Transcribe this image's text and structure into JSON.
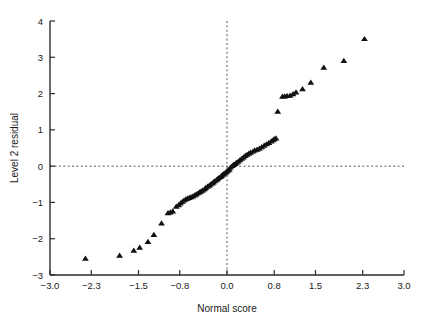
{
  "chart_data": {
    "type": "scatter",
    "title": "",
    "xlabel": "Normal score",
    "ylabel": "Level 2 residual",
    "xlim": [
      -3.0,
      3.0
    ],
    "ylim": [
      -3,
      4
    ],
    "xticks": [
      -3.0,
      -2.3,
      -1.5,
      -0.8,
      0.0,
      0.8,
      1.5,
      2.3,
      3.0
    ],
    "xtick_labels": [
      "-3.0",
      "-2.3",
      "-1.5",
      "-0.8",
      "0.0",
      "0.8",
      "1.5",
      "2.3",
      "3.0"
    ],
    "yticks": [
      -3,
      -2,
      -1,
      0,
      1,
      2,
      3,
      4
    ],
    "ytick_labels": [
      "-3",
      "-2",
      "-1",
      "0",
      "1",
      "2",
      "3",
      "4"
    ],
    "grid": false,
    "legend": false,
    "marker": "triangle-up",
    "marker_color": "#111111",
    "reference_lines": [
      {
        "orientation": "horizontal",
        "value": 0,
        "style": "dotted"
      },
      {
        "orientation": "vertical",
        "value": 0,
        "style": "dashed"
      }
    ],
    "series": [
      {
        "name": "Level 2 residual vs normal score",
        "points": [
          [
            -2.4,
            -2.55
          ],
          [
            -1.82,
            -2.47
          ],
          [
            -1.58,
            -2.33
          ],
          [
            -1.48,
            -2.25
          ],
          [
            -1.34,
            -2.09
          ],
          [
            -1.24,
            -1.9
          ],
          [
            -1.11,
            -1.58
          ],
          [
            -1.0,
            -1.3
          ],
          [
            -0.96,
            -1.28
          ],
          [
            -0.92,
            -1.25
          ],
          [
            -0.86,
            -1.12
          ],
          [
            -0.82,
            -1.08
          ],
          [
            -0.79,
            -1.03
          ],
          [
            -0.76,
            -0.99
          ],
          [
            -0.73,
            -0.95
          ],
          [
            -0.7,
            -0.92
          ],
          [
            -0.67,
            -0.9
          ],
          [
            -0.64,
            -0.88
          ],
          [
            -0.61,
            -0.86
          ],
          [
            -0.58,
            -0.84
          ],
          [
            -0.55,
            -0.81
          ],
          [
            -0.52,
            -0.78
          ],
          [
            -0.49,
            -0.75
          ],
          [
            -0.46,
            -0.72
          ],
          [
            -0.44,
            -0.7
          ],
          [
            -0.41,
            -0.67
          ],
          [
            -0.38,
            -0.64
          ],
          [
            -0.36,
            -0.6
          ],
          [
            -0.33,
            -0.57
          ],
          [
            -0.3,
            -0.54
          ],
          [
            -0.28,
            -0.51
          ],
          [
            -0.25,
            -0.48
          ],
          [
            -0.23,
            -0.45
          ],
          [
            -0.21,
            -0.42
          ],
          [
            -0.18,
            -0.39
          ],
          [
            -0.16,
            -0.36
          ],
          [
            -0.14,
            -0.33
          ],
          [
            -0.11,
            -0.3
          ],
          [
            -0.09,
            -0.27
          ],
          [
            -0.07,
            -0.24
          ],
          [
            -0.05,
            -0.21
          ],
          [
            -0.02,
            -0.18
          ],
          [
            0.0,
            -0.15
          ],
          [
            0.02,
            -0.12
          ],
          [
            0.04,
            -0.09
          ],
          [
            0.06,
            -0.04
          ],
          [
            0.09,
            0.0
          ],
          [
            0.11,
            0.03
          ],
          [
            0.14,
            0.06
          ],
          [
            0.16,
            0.09
          ],
          [
            0.19,
            0.12
          ],
          [
            0.22,
            0.16
          ],
          [
            0.25,
            0.2
          ],
          [
            0.28,
            0.24
          ],
          [
            0.31,
            0.28
          ],
          [
            0.34,
            0.31
          ],
          [
            0.37,
            0.34
          ],
          [
            0.4,
            0.37
          ],
          [
            0.44,
            0.4
          ],
          [
            0.47,
            0.43
          ],
          [
            0.51,
            0.45
          ],
          [
            0.55,
            0.48
          ],
          [
            0.59,
            0.52
          ],
          [
            0.63,
            0.56
          ],
          [
            0.67,
            0.6
          ],
          [
            0.71,
            0.64
          ],
          [
            0.75,
            0.68
          ],
          [
            0.78,
            0.71
          ],
          [
            0.8,
            0.74
          ],
          [
            0.83,
            0.76
          ],
          [
            0.86,
            1.5
          ],
          [
            0.94,
            1.91
          ],
          [
            0.98,
            1.92
          ],
          [
            1.02,
            1.93
          ],
          [
            1.07,
            1.94
          ],
          [
            1.12,
            1.98
          ],
          [
            1.17,
            2.03
          ],
          [
            1.28,
            2.12
          ],
          [
            1.42,
            2.3
          ],
          [
            1.64,
            2.71
          ],
          [
            1.98,
            2.9
          ],
          [
            2.33,
            3.5
          ]
        ]
      }
    ]
  },
  "axes": {
    "x_axis_name": "normal-score-axis",
    "y_axis_name": "level2-residual-axis"
  }
}
